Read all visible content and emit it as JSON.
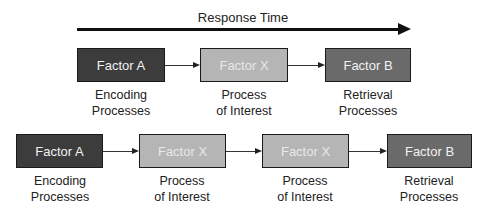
{
  "axis": {
    "label": "Response Time"
  },
  "top_row": {
    "boxes": [
      {
        "label": "Factor A",
        "caption_line1": "Encoding",
        "caption_line2": "Processes",
        "shade": "#3c3c3c"
      },
      {
        "label": "Factor X",
        "caption_line1": "Process",
        "caption_line2": "of Interest",
        "shade": "#b5b5b5"
      },
      {
        "label": "Factor B",
        "caption_line1": "Retrieval",
        "caption_line2": "Processes",
        "shade": "#6a6a6a"
      }
    ]
  },
  "bottom_row": {
    "boxes": [
      {
        "label": "Factor A",
        "caption_line1": "Encoding",
        "caption_line2": "Processes",
        "shade": "#3c3c3c"
      },
      {
        "label": "Factor X",
        "caption_line1": "Process",
        "caption_line2": "of Interest",
        "shade": "#b5b5b5"
      },
      {
        "label": "Factor X",
        "caption_line1": "Process",
        "caption_line2": "of Interest",
        "shade": "#b5b5b5"
      },
      {
        "label": "Factor B",
        "caption_line1": "Retrieval",
        "caption_line2": "Processes",
        "shade": "#6a6a6a"
      }
    ]
  }
}
